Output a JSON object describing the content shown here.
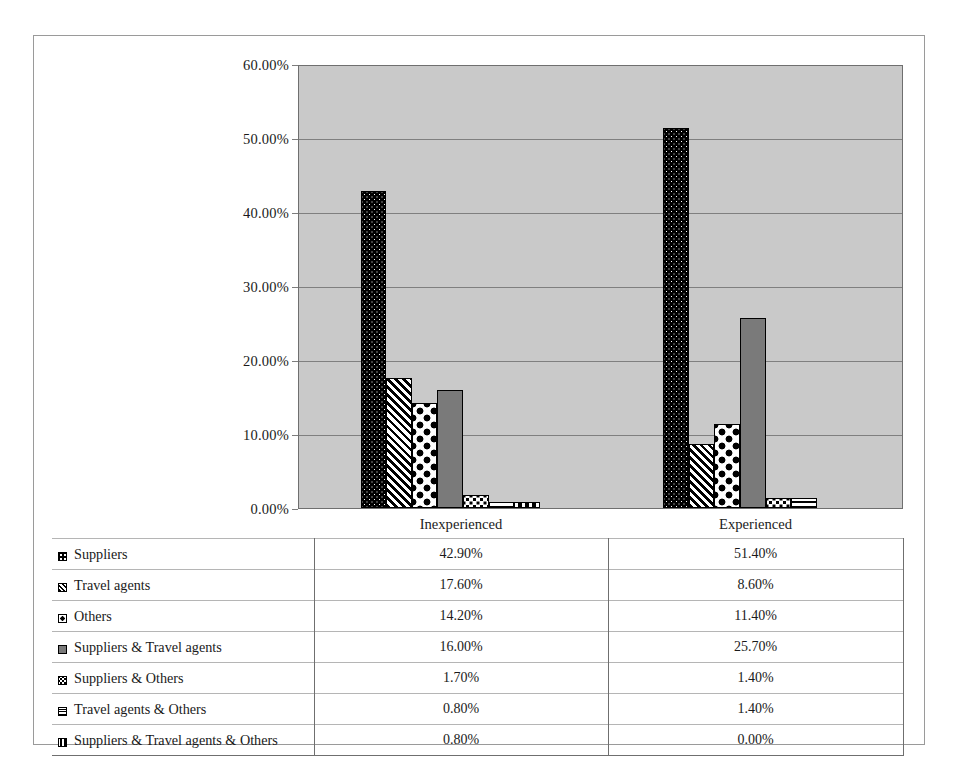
{
  "chart_data": {
    "type": "bar",
    "title": "",
    "subtitle": "",
    "xlabel": "",
    "ylabel": "",
    "categories": [
      "Inexperienced",
      "Experienced"
    ],
    "ylim": [
      0,
      60
    ],
    "ytick_labels": [
      "0.00%",
      "10.00%",
      "20.00%",
      "30.00%",
      "40.00%",
      "50.00%",
      "60.00%"
    ],
    "ytick_values": [
      0,
      10,
      20,
      30,
      40,
      50,
      60
    ],
    "grid": true,
    "legend_position": "data-table-below",
    "value_suffix": "%",
    "series": [
      {
        "name": "Suppliers",
        "pattern": "dots",
        "values": [
          42.9,
          51.4
        ],
        "labels": [
          "42.90%",
          "51.40%"
        ]
      },
      {
        "name": "Travel agents",
        "pattern": "diag",
        "values": [
          17.6,
          8.6
        ],
        "labels": [
          "17.60%",
          "8.60%"
        ]
      },
      {
        "name": "Others",
        "pattern": "diamond",
        "values": [
          14.2,
          11.4
        ],
        "labels": [
          "14.20%",
          "11.40%"
        ]
      },
      {
        "name": "Suppliers & Travel agents",
        "pattern": "solidgray",
        "values": [
          16.0,
          25.7
        ],
        "labels": [
          "16.00%",
          "25.70%"
        ]
      },
      {
        "name": "Suppliers & Others",
        "pattern": "checker",
        "values": [
          1.7,
          1.4
        ],
        "labels": [
          "1.70%",
          "1.40%"
        ]
      },
      {
        "name": "Travel agents & Others",
        "pattern": "horiz",
        "values": [
          0.8,
          1.4
        ],
        "labels": [
          "0.80%",
          "1.40%"
        ]
      },
      {
        "name": "Suppliers & Travel agents & Others",
        "pattern": "dash",
        "values": [
          0.8,
          0.0
        ],
        "labels": [
          "0.80%",
          "0.00%"
        ]
      }
    ],
    "colors": {
      "plot_background": "#c9c9c9",
      "gridline": "#7f7f7f",
      "axis": "#6f6f6f",
      "bar_outline": "#000000",
      "solid_gray_series": "#7a7a7a",
      "page_background": "#ffffff"
    }
  }
}
